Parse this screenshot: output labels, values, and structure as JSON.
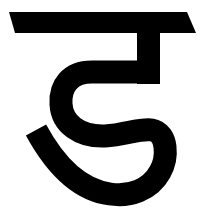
{
  "glyph": {
    "character": "ट",
    "description": "Devanagari letter glyph in black on white",
    "ink_color": "#000000",
    "background_color": "#ffffff"
  }
}
